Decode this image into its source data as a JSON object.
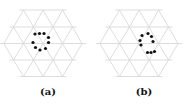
{
  "figure": {
    "grid": {
      "type": "triangular-lattice",
      "line_color": "#d4d4d4",
      "rows_y": [
        10,
        27,
        43.5,
        60,
        76.5
      ],
      "side": 19.5
    },
    "panels": [
      {
        "id": "a",
        "label": "(a)",
        "offset_x": 0,
        "dots": [
          [
            35,
            34
          ],
          [
            39.5,
            33.5
          ],
          [
            44,
            33.5
          ],
          [
            33,
            42.5
          ],
          [
            35.5,
            47.5
          ],
          [
            40,
            50
          ],
          [
            48.5,
            37.5
          ],
          [
            48.5,
            42.5
          ],
          [
            45.5,
            48.5
          ]
        ]
      },
      {
        "id": "b",
        "label": "(b)",
        "offset_x": 96,
        "dots": [
          [
            142,
            35.5
          ],
          [
            140,
            40.5
          ],
          [
            141,
            45
          ],
          [
            148,
            33.5
          ],
          [
            151.5,
            36.5
          ],
          [
            153,
            41.5
          ],
          [
            147.5,
            52.5
          ],
          [
            151,
            52.5
          ],
          [
            154.5,
            51.5
          ]
        ]
      }
    ],
    "dot_color": "#111111",
    "dot_radius": 1.6
  }
}
